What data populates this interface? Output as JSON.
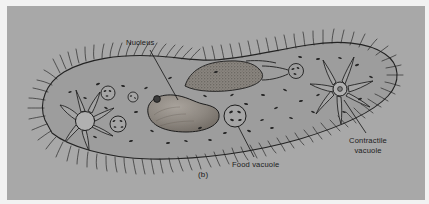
{
  "figure": {
    "caption": "(b)",
    "panel_background": "#a8a8a8",
    "page_background": "#f2f2f2",
    "ink_color": "#1b1b1b"
  },
  "labels": {
    "nucleus": "Nucleus",
    "food_vacuole": "Food vacuole",
    "contractile_vacuole_line1": "Contractile",
    "contractile_vacuole_line2": "vacuole"
  },
  "structures": [
    {
      "name": "pellicle-outline",
      "description": "slipper-shaped cell membrane outline"
    },
    {
      "name": "cilia-fringe",
      "description": "hair-like cilia around entire cell border"
    },
    {
      "name": "oral-groove",
      "description": "stippled ciliated oral groove on upper left of mouth"
    },
    {
      "name": "gullet",
      "description": "funnel-shaped cytopharynx leading from oral groove"
    },
    {
      "name": "forming-food-vacuole",
      "description": "small vacuole at base of gullet"
    },
    {
      "name": "macronucleus",
      "description": "large kidney-bean shaped shaded nucleus"
    },
    {
      "name": "micronucleus",
      "description": "small dark round body adjacent to macronucleus"
    },
    {
      "name": "food-vacuole",
      "description": "round vacuole with internal dark particles"
    },
    {
      "name": "contractile-vacuole-anterior",
      "description": "left star vacuole with radiating canals"
    },
    {
      "name": "contractile-vacuole-posterior",
      "description": "right star vacuole with radiating canals"
    },
    {
      "name": "cytoplasm-granules",
      "description": "scattered dark dash-shaped granules"
    },
    {
      "name": "small-vacuoles",
      "description": "three small circular vacuoles with dots at left"
    }
  ]
}
